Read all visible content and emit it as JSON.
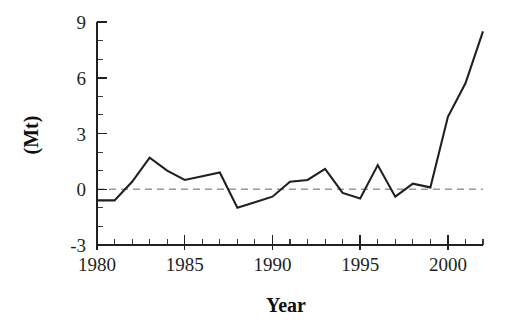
{
  "chart_data": {
    "type": "line",
    "title": "",
    "subtitle": "",
    "xlabel": "Year",
    "ylabel": "(Mt)",
    "xlim": [
      1980,
      2002
    ],
    "ylim": [
      -3,
      9
    ],
    "grid": false,
    "legend": null,
    "x_major_ticks": [
      1980,
      1985,
      1990,
      1995,
      2000
    ],
    "x_minor_tick_interval": 1,
    "y_major_ticks": [
      -3,
      0,
      3,
      6,
      9
    ],
    "y_minor_tick_interval": 1,
    "x_tick_labels": [
      "1980",
      "1985",
      "1990",
      "1995",
      "2000"
    ],
    "y_tick_labels": [
      "-3",
      "0",
      "3",
      "6",
      "9"
    ],
    "reference_lines": [
      {
        "name": "zero-line",
        "y": 0,
        "style": "dashed",
        "color": "#9a9a9a"
      }
    ],
    "series": [
      {
        "name": "annual-change",
        "color": "#231f20",
        "x": [
          1980,
          1981,
          1982,
          1983,
          1984,
          1985,
          1986,
          1987,
          1988,
          1989,
          1990,
          1991,
          1992,
          1993,
          1994,
          1995,
          1996,
          1997,
          1998,
          1999,
          2000,
          2001,
          2002
        ],
        "values": [
          -0.6,
          -0.6,
          0.4,
          1.7,
          1.0,
          0.5,
          0.7,
          0.9,
          -1.0,
          -0.7,
          -0.4,
          0.4,
          0.5,
          1.1,
          -0.2,
          -0.5,
          1.3,
          -0.4,
          0.3,
          0.1,
          3.9,
          5.7,
          8.5
        ]
      }
    ]
  },
  "axes": {
    "y_title": "(Mt)",
    "x_title": "Year"
  }
}
